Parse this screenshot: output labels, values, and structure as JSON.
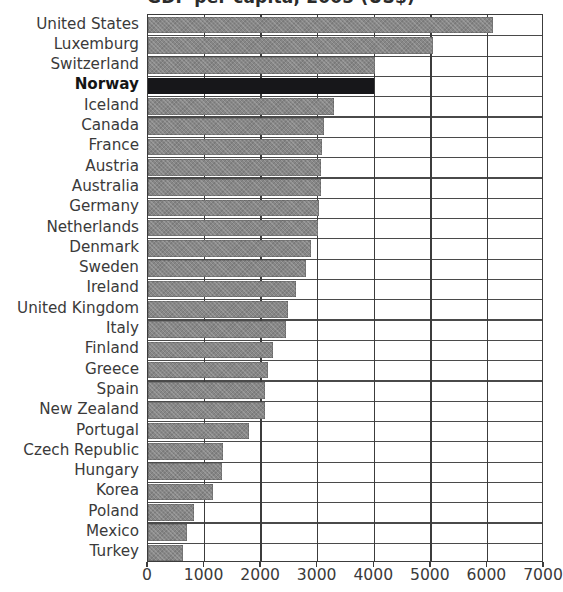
{
  "chart_data": {
    "type": "bar",
    "orientation": "horizontal",
    "title": "GDP per capita, 2005 (US$)",
    "xlabel": "",
    "ylabel": "",
    "xlim": [
      0,
      7000
    ],
    "xticks": [
      0,
      1000,
      2000,
      3000,
      4000,
      5000,
      6000,
      7000
    ],
    "xtick_labels": [
      "0",
      "1000",
      "2000",
      "3000",
      "4000",
      "5000",
      "6000",
      "7000"
    ],
    "grid": "vertical-and-row-separators",
    "legend": "none",
    "highlight_category": "Norway",
    "bar_color": "#878787",
    "highlight_color": "#17171a",
    "axis_color": "#3c3c3c",
    "categories": [
      "United States",
      "Luxemburg",
      "Switzerland",
      "Norway",
      "Iceland",
      "Canada",
      "France",
      "Austria",
      "Australia",
      "Germany",
      "Netherlands",
      "Denmark",
      "Sweden",
      "Ireland",
      "United Kingdom",
      "Italy",
      "Finland",
      "Greece",
      "Spain",
      "New Zealand",
      "Portugal",
      "Czech Republic",
      "Hungary",
      "Korea",
      "Poland",
      "Mexico",
      "Turkey"
    ],
    "values": [
      6100,
      5040,
      4010,
      4000,
      3290,
      3110,
      3070,
      3060,
      3060,
      3030,
      3010,
      2880,
      2790,
      2610,
      2470,
      2440,
      2210,
      2120,
      2060,
      2070,
      1780,
      1320,
      1310,
      1150,
      820,
      690,
      610
    ]
  }
}
